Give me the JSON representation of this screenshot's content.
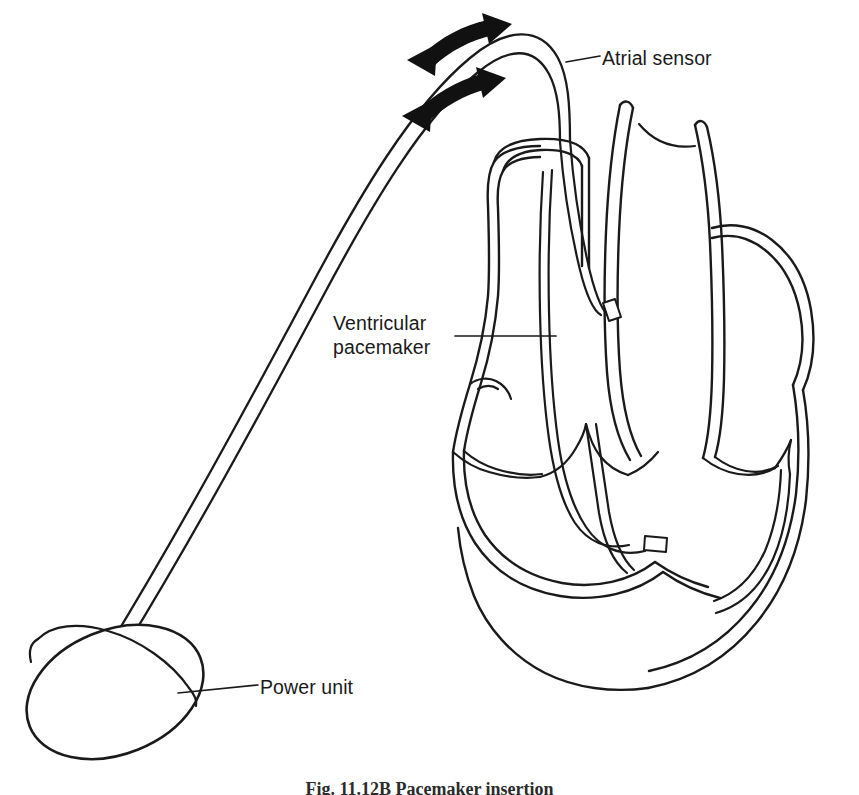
{
  "figure": {
    "background_color": "#ffffff",
    "ink_color": "#1a1a1a",
    "width": 859,
    "height": 795
  },
  "labels": {
    "atrial_sensor": "Atrial sensor",
    "ventricular_pacemaker_line1": "Ventricular",
    "ventricular_pacemaker_line2": "pacemaker",
    "power_unit": "Power unit"
  },
  "caption": {
    "text": "Fig. 11.12B  Pacemaker insertion"
  },
  "parts": [
    {
      "name": "power-unit",
      "shape": "tilted-ellipse-disc",
      "label": "Power unit"
    },
    {
      "name": "pacing-lead",
      "shape": "long-curved-double-line-catheter"
    },
    {
      "name": "atrial-electrode-tip",
      "shape": "small-rectangle"
    },
    {
      "name": "ventricular-electrode-tip",
      "shape": "small-rectangle"
    },
    {
      "name": "heart-cross-section",
      "shape": "line-art-outline"
    },
    {
      "name": "superior-vena-cava",
      "shape": "cut-open-vessel"
    },
    {
      "name": "aorta",
      "shape": "vessel"
    },
    {
      "name": "pulmonary-artery",
      "shape": "vessel"
    },
    {
      "name": "insertion-arrow-upper",
      "shape": "bold-curved-arrow"
    },
    {
      "name": "insertion-arrow-lower",
      "shape": "bold-curved-arrow"
    }
  ]
}
